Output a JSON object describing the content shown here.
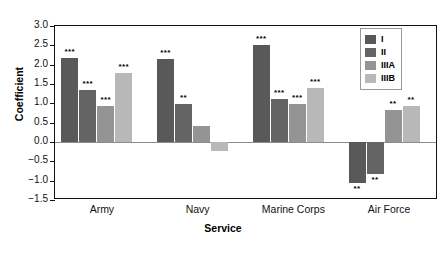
{
  "chart_data": {
    "type": "bar",
    "title": "",
    "xlabel": "Service",
    "ylabel": "Coefficient",
    "categories": [
      "Army",
      "Navy",
      "Marine Corps",
      "Air Force"
    ],
    "ylim": [
      -1.5,
      3.0
    ],
    "ytick_step": 0.5,
    "yticks": [
      "3.0",
      "2.5",
      "2.0",
      "1.5",
      "1.0",
      "0.5",
      "0.0",
      "-0.5",
      "-1.0",
      "-1.5"
    ],
    "ytick_values": [
      3.0,
      2.5,
      2.0,
      1.5,
      1.0,
      0.5,
      0.0,
      -0.5,
      -1.0,
      -1.5
    ],
    "grid": false,
    "legend_position": "top-right",
    "series": [
      {
        "name": "I",
        "color": "#595959",
        "values": [
          2.18,
          2.15,
          2.5,
          -1.05
        ],
        "annotations": [
          "***",
          "***",
          "***",
          "**"
        ]
      },
      {
        "name": "II",
        "color": "#646464",
        "values": [
          1.35,
          0.97,
          1.12,
          -0.83
        ],
        "annotations": [
          "***",
          "**",
          "***",
          "**"
        ]
      },
      {
        "name": "IIIA",
        "color": "#949494",
        "values": [
          0.93,
          0.42,
          0.98,
          0.82
        ],
        "annotations": [
          "***",
          "",
          "***",
          "**"
        ]
      },
      {
        "name": "IIIB",
        "color": "#b8b8b8",
        "values": [
          1.78,
          -0.22,
          1.4,
          0.93
        ],
        "annotations": [
          "***",
          "",
          "***",
          "**"
        ]
      }
    ]
  },
  "legend": {
    "items": [
      {
        "label": "I",
        "color": "#595959"
      },
      {
        "label": "II",
        "color": "#646464"
      },
      {
        "label": "IIIA",
        "color": "#949494"
      },
      {
        "label": "IIIB",
        "color": "#b8b8b8"
      }
    ]
  }
}
